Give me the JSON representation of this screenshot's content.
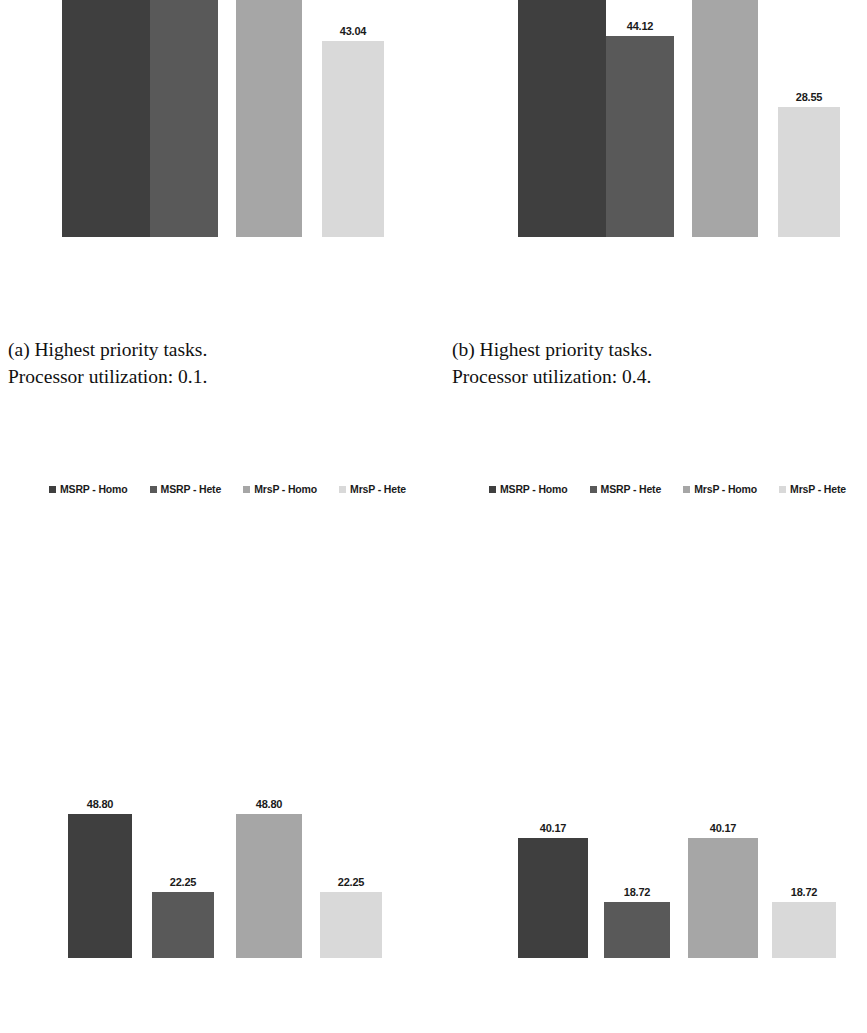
{
  "figure": {
    "background": "#ffffff",
    "series_colors": [
      "#3f3f3f",
      "#595959",
      "#a6a6a6",
      "#d9d9d9"
    ],
    "label_color": "#1a1a1a"
  },
  "legend": {
    "items": [
      {
        "label": "MSRP - Homo",
        "color": "#3f3f3f"
      },
      {
        "label": "MSRP - Hete",
        "color": "#595959"
      },
      {
        "label": "MrsP - Homo",
        "color": "#a6a6a6"
      },
      {
        "label": "MrsP - Hete",
        "color": "#d9d9d9"
      }
    ]
  },
  "captions": {
    "a": "(a) Highest priority tasks.\nProcessor utilization: 0.1.",
    "b": "(b) Highest priority tasks.\nProcessor utilization: 0.4."
  },
  "chart_data": [
    {
      "id": "top-left",
      "type": "bar",
      "title": "",
      "xlabel": "",
      "ylabel": "",
      "categories": [
        "MSRP - Homo",
        "MSRP - Hete",
        "MrsP - Homo",
        "MrsP - Hete"
      ],
      "values": [
        null,
        63.42,
        null,
        43.04
      ],
      "value_labels": [
        "",
        "63.42",
        "",
        "43.04"
      ],
      "colors": [
        "#3f3f3f",
        "#595959",
        "#a6a6a6",
        "#d9d9d9"
      ],
      "grid": false,
      "legend_position": "bottom",
      "note": "bars 1 and 3 extend above the top edge of the image (values not shown)"
    },
    {
      "id": "top-right",
      "type": "bar",
      "title": "",
      "xlabel": "",
      "ylabel": "",
      "categories": [
        "MSRP - Homo",
        "MSRP - Hete",
        "MrsP - Homo",
        "MrsP - Hete"
      ],
      "values": [
        null,
        44.12,
        59.64,
        28.55
      ],
      "value_labels": [
        "",
        "44.12",
        "59.64",
        "28.55"
      ],
      "colors": [
        "#3f3f3f",
        "#595959",
        "#a6a6a6",
        "#d9d9d9"
      ],
      "grid": false,
      "legend_position": "bottom",
      "note": "bar 1 extends above the top edge of the image (value not shown)"
    },
    {
      "id": "bottom-left",
      "type": "bar",
      "title": "",
      "xlabel": "",
      "ylabel": "",
      "categories": [
        "MSRP - Homo",
        "MSRP - Hete",
        "MrsP - Homo",
        "MrsP - Hete"
      ],
      "values": [
        48.8,
        22.25,
        48.8,
        22.25
      ],
      "value_labels": [
        "48.80",
        "22.25",
        "48.80",
        "22.25"
      ],
      "colors": [
        "#3f3f3f",
        "#595959",
        "#a6a6a6",
        "#d9d9d9"
      ],
      "grid": false,
      "legend_position": "top"
    },
    {
      "id": "bottom-right",
      "type": "bar",
      "title": "",
      "xlabel": "",
      "ylabel": "",
      "categories": [
        "MSRP - Homo",
        "MSRP - Hete",
        "MrsP - Homo",
        "MrsP - Hete"
      ],
      "values": [
        40.17,
        18.72,
        40.17,
        18.72
      ],
      "value_labels": [
        "40.17",
        "18.72",
        "40.17",
        "18.72"
      ],
      "colors": [
        "#3f3f3f",
        "#595959",
        "#a6a6a6",
        "#d9d9d9"
      ],
      "grid": false,
      "legend_position": "top"
    }
  ]
}
